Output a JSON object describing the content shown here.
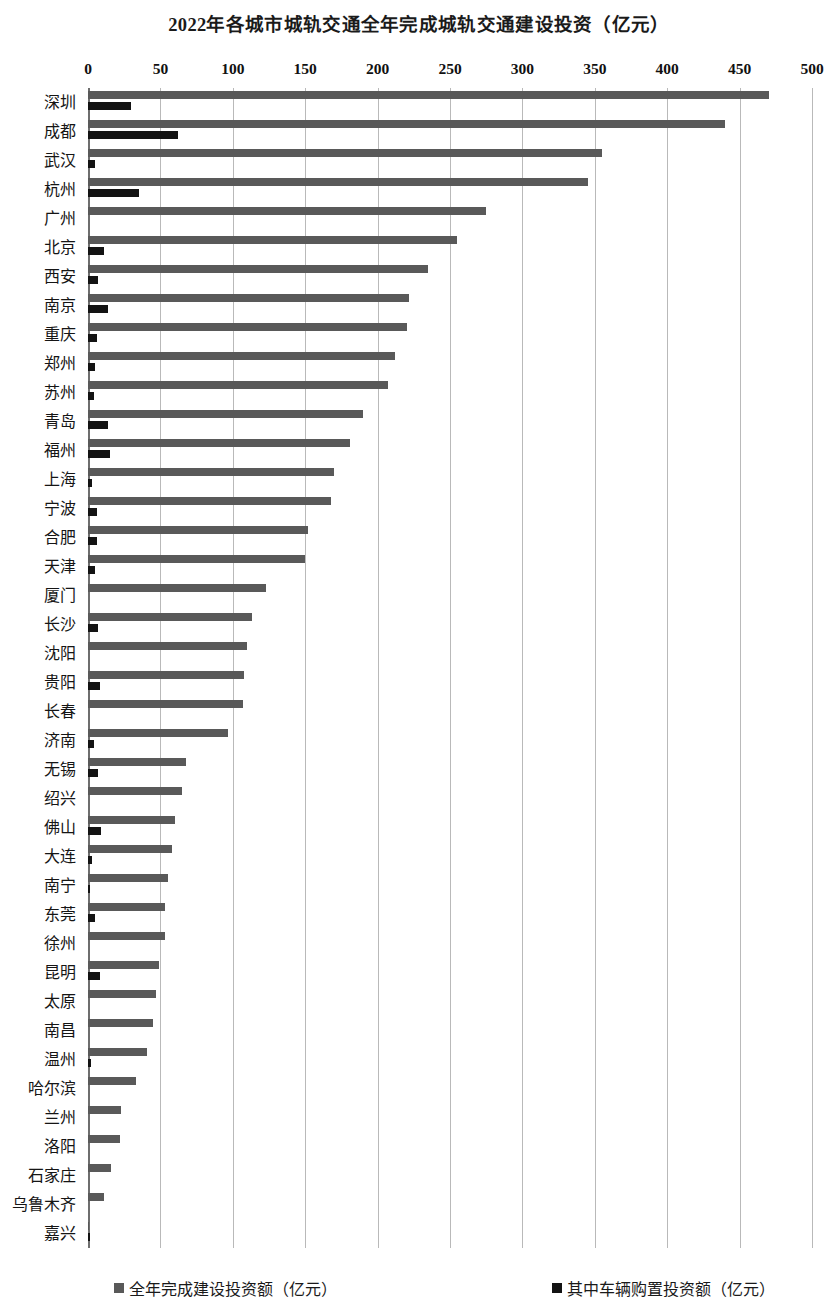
{
  "chart_data": {
    "type": "bar",
    "orientation": "horizontal",
    "title": "2022年各城市城轨交通全年完成城轨交通建设投资（亿元）",
    "xlabel": "",
    "ylabel": "",
    "xlim": [
      0,
      500
    ],
    "xticks": [
      0,
      50,
      100,
      150,
      200,
      250,
      300,
      350,
      400,
      450,
      500
    ],
    "xtick_labels": [
      "0",
      "50",
      "100",
      "150",
      "200",
      "250",
      "300",
      "350",
      "400",
      "450",
      "500"
    ],
    "grid": true,
    "legend_position": "bottom",
    "categories": [
      "深圳",
      "成都",
      "武汉",
      "杭州",
      "广州",
      "北京",
      "西安",
      "南京",
      "重庆",
      "郑州",
      "苏州",
      "青岛",
      "福州",
      "上海",
      "宁波",
      "合肥",
      "天津",
      "厦门",
      "长沙",
      "沈阳",
      "贵阳",
      "长春",
      "济南",
      "无锡",
      "绍兴",
      "佛山",
      "大连",
      "南宁",
      "东莞",
      "徐州",
      "昆明",
      "太原",
      "南昌",
      "温州",
      "哈尔滨",
      "兰州",
      "洛阳",
      "石家庄",
      "乌鲁木齐",
      "嘉兴"
    ],
    "series": [
      {
        "name": "全年完成建设投资额（亿元）",
        "color": "#595959",
        "values": [
          470,
          440,
          355,
          345,
          275,
          255,
          235,
          222,
          220,
          212,
          207,
          190,
          181,
          170,
          168,
          152,
          150,
          123,
          113,
          110,
          108,
          107,
          97,
          68,
          65,
          60,
          58,
          55,
          53,
          53,
          49,
          47,
          45,
          41,
          33,
          23,
          22,
          16,
          11,
          1
        ]
      },
      {
        "name": "其中车辆购置投资额（亿元）",
        "color": "#131313",
        "values": [
          30,
          62,
          5,
          35,
          0,
          11,
          7,
          14,
          6,
          5,
          4,
          14,
          15,
          3,
          6,
          6,
          5,
          0,
          7,
          0,
          8,
          0,
          4,
          7,
          0,
          9,
          3,
          1,
          5,
          0,
          8,
          0,
          0,
          2,
          0,
          0,
          0,
          0,
          0,
          1
        ]
      }
    ]
  },
  "legend": [
    {
      "label": "全年完成建设投资额（亿元）",
      "color": "#595959"
    },
    {
      "label": "其中车辆购置投资额（亿元）",
      "color": "#131313"
    }
  ]
}
